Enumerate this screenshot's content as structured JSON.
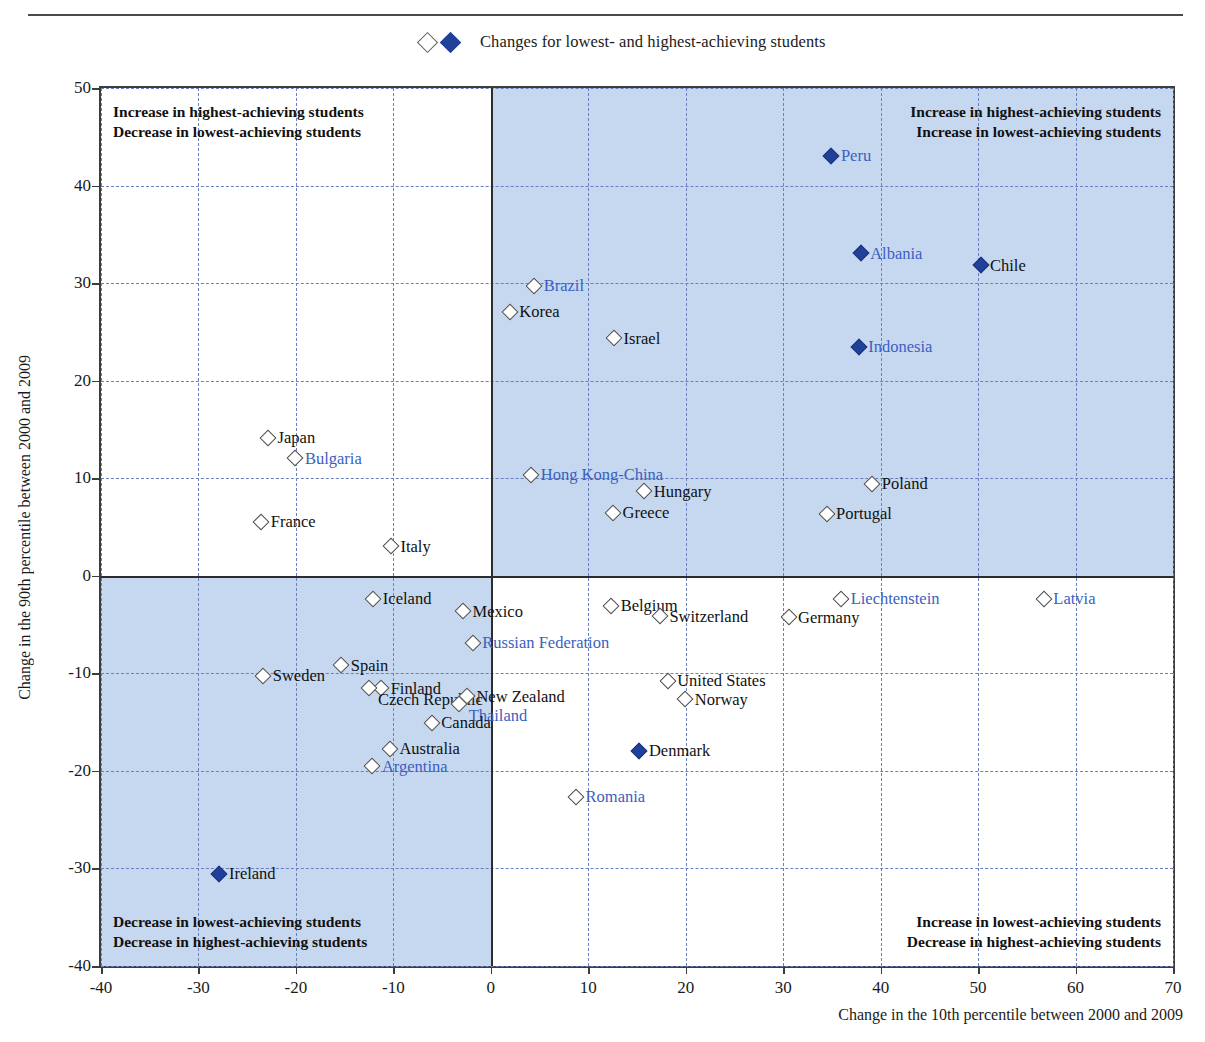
{
  "legend": {
    "open_marker": "open-diamond-icon",
    "filled_marker": "filled-diamond-icon",
    "label": "Changes for lowest- and highest-achieving students"
  },
  "axes": {
    "ylabel": "Change in the 90th percentile between 2000 and 2009",
    "xlabel": "Change in the 10th percentile between 2000 and 2009",
    "yticks": [
      "50",
      "40",
      "30",
      "20",
      "10",
      "0",
      "-10",
      "-20",
      "-30",
      "-40"
    ],
    "xticks": [
      "-40",
      "-30",
      "-20",
      "-10",
      "0",
      "10",
      "20",
      "30",
      "40",
      "50",
      "60",
      "70"
    ]
  },
  "quadrant_notes": {
    "top_left": [
      "Increase in highest-achieving students",
      "Decrease in lowest-achieving students"
    ],
    "top_right": [
      "Increase in highest-achieving students",
      "Increase in lowest-achieving students"
    ],
    "bottom_left": [
      "Decrease in lowest-achieving students",
      "Decrease in highest-achieving students"
    ],
    "bottom_right": [
      "Increase in lowest-achieving students",
      "Decrease in highest-achieving students"
    ]
  },
  "colors": {
    "accent_blue": "#20409a",
    "label_blue": "#3b5fc0",
    "shade_blue": "#c6d8f0",
    "grid_blue": "#6a7fbf",
    "axis_dark": "#2d2d2d"
  },
  "chart_data": {
    "type": "scatter",
    "title": "",
    "xlabel": "Change in the 10th percentile between 2000 and 2009",
    "ylabel": "Change in the 90th percentile between 2000 and 2009",
    "xlim": [
      -40,
      70
    ],
    "ylim": [
      -40,
      50
    ],
    "grid": true,
    "legend_position": "top-center",
    "legend_entries": [
      "Changes for lowest- and highest-achieving students"
    ],
    "marker_styles": {
      "open": "not statistically significant / lowest-achieving",
      "filled": "statistically significant / highest-achieving"
    },
    "points": [
      {
        "name": "Peru",
        "x": 35.0,
        "y": 43.0,
        "marker": "filled",
        "label_color": "blue",
        "label_side": "right"
      },
      {
        "name": "Albania",
        "x": 38.0,
        "y": 33.0,
        "marker": "filled",
        "label_color": "blue",
        "label_side": "right"
      },
      {
        "name": "Chile",
        "x": 50.3,
        "y": 31.8,
        "marker": "filled",
        "label_color": "black",
        "label_side": "right"
      },
      {
        "name": "Brazil",
        "x": 4.5,
        "y": 29.7,
        "marker": "open",
        "label_color": "blue",
        "label_side": "right"
      },
      {
        "name": "Korea",
        "x": 2.0,
        "y": 27.0,
        "marker": "open",
        "label_color": "black",
        "label_side": "right"
      },
      {
        "name": "Israel",
        "x": 12.7,
        "y": 24.3,
        "marker": "open",
        "label_color": "black",
        "label_side": "right"
      },
      {
        "name": "Indonesia",
        "x": 37.8,
        "y": 23.4,
        "marker": "filled",
        "label_color": "blue",
        "label_side": "right"
      },
      {
        "name": "Japan",
        "x": -22.8,
        "y": 14.1,
        "marker": "open",
        "label_color": "black",
        "label_side": "right"
      },
      {
        "name": "Bulgaria",
        "x": -20.0,
        "y": 12.0,
        "marker": "open",
        "label_color": "blue",
        "label_side": "right"
      },
      {
        "name": "Hong Kong-China",
        "x": 4.2,
        "y": 10.3,
        "marker": "open",
        "label_color": "blue",
        "label_side": "right"
      },
      {
        "name": "Poland",
        "x": 39.2,
        "y": 9.4,
        "marker": "open",
        "label_color": "black",
        "label_side": "right"
      },
      {
        "name": "Hungary",
        "x": 15.8,
        "y": 8.6,
        "marker": "open",
        "label_color": "black",
        "label_side": "right"
      },
      {
        "name": "Greece",
        "x": 12.6,
        "y": 6.4,
        "marker": "open",
        "label_color": "black",
        "label_side": "right"
      },
      {
        "name": "Portugal",
        "x": 34.5,
        "y": 6.3,
        "marker": "open",
        "label_color": "black",
        "label_side": "right"
      },
      {
        "name": "France",
        "x": -23.5,
        "y": 5.5,
        "marker": "open",
        "label_color": "black",
        "label_side": "right"
      },
      {
        "name": "Italy",
        "x": -10.2,
        "y": 3.0,
        "marker": "open",
        "label_color": "black",
        "label_side": "right"
      },
      {
        "name": "Iceland",
        "x": -12.0,
        "y": -2.4,
        "marker": "open",
        "label_color": "black",
        "label_side": "right"
      },
      {
        "name": "Liechtenstein",
        "x": 36.0,
        "y": -2.4,
        "marker": "open",
        "label_color": "blue",
        "label_side": "right"
      },
      {
        "name": "Latvia",
        "x": 56.8,
        "y": -2.4,
        "marker": "open",
        "label_color": "blue",
        "label_side": "right"
      },
      {
        "name": "Belgium",
        "x": 12.4,
        "y": -3.1,
        "marker": "open",
        "label_color": "black",
        "label_side": "right"
      },
      {
        "name": "Mexico",
        "x": -2.8,
        "y": -3.7,
        "marker": "open",
        "label_color": "black",
        "label_side": "right"
      },
      {
        "name": "Switzerland",
        "x": 17.4,
        "y": -4.2,
        "marker": "open",
        "label_color": "black",
        "label_side": "right"
      },
      {
        "name": "Germany",
        "x": 30.6,
        "y": -4.3,
        "marker": "open",
        "label_color": "black",
        "label_side": "right"
      },
      {
        "name": "Russian Federation",
        "x": -1.8,
        "y": -6.9,
        "marker": "open",
        "label_color": "blue",
        "label_side": "right"
      },
      {
        "name": "Spain",
        "x": -15.3,
        "y": -9.2,
        "marker": "open",
        "label_color": "black",
        "label_side": "right"
      },
      {
        "name": "Sweden",
        "x": -23.3,
        "y": -10.3,
        "marker": "open",
        "label_color": "black",
        "label_side": "right"
      },
      {
        "name": "United States",
        "x": 18.2,
        "y": -10.8,
        "marker": "open",
        "label_color": "black",
        "label_side": "right"
      },
      {
        "name": "Finland",
        "x": -11.2,
        "y": -11.6,
        "marker": "open",
        "label_color": "black",
        "label_side": "right"
      },
      {
        "name": "Czech Republic",
        "x": -12.5,
        "y": -11.6,
        "marker": "open",
        "label_color": "black",
        "label_side": "below"
      },
      {
        "name": "New Zealand",
        "x": -2.4,
        "y": -12.4,
        "marker": "open",
        "label_color": "black",
        "label_side": "right"
      },
      {
        "name": "Norway",
        "x": 20.0,
        "y": -12.7,
        "marker": "open",
        "label_color": "black",
        "label_side": "right"
      },
      {
        "name": "Thailand",
        "x": -3.2,
        "y": -13.2,
        "marker": "open",
        "label_color": "blue",
        "label_side": "below"
      },
      {
        "name": "Canada",
        "x": -6.0,
        "y": -15.1,
        "marker": "open",
        "label_color": "black",
        "label_side": "right"
      },
      {
        "name": "Australia",
        "x": -10.3,
        "y": -17.8,
        "marker": "open",
        "label_color": "black",
        "label_side": "right"
      },
      {
        "name": "Denmark",
        "x": 15.3,
        "y": -18.0,
        "marker": "filled",
        "label_color": "black",
        "label_side": "right"
      },
      {
        "name": "Argentina",
        "x": -12.1,
        "y": -19.6,
        "marker": "open",
        "label_color": "blue",
        "label_side": "right"
      },
      {
        "name": "Romania",
        "x": 8.8,
        "y": -22.7,
        "marker": "open",
        "label_color": "blue",
        "label_side": "right"
      },
      {
        "name": "Ireland",
        "x": -27.8,
        "y": -30.6,
        "marker": "filled",
        "label_color": "black",
        "label_side": "right"
      }
    ]
  }
}
